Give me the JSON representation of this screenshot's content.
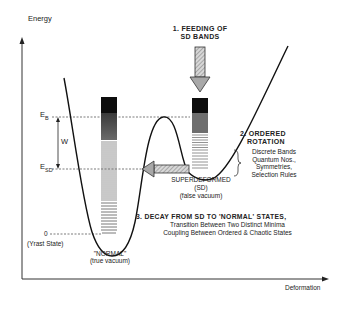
{
  "axes": {
    "y_label": "Energy",
    "x_label": "Deformation"
  },
  "energy_levels": {
    "eb_label": "E",
    "eb_sub": "B",
    "esd_label": "E",
    "esd_sub": "SD",
    "width_label": "W",
    "zero_label": "0",
    "zero_note": "(Yrast State)"
  },
  "wells": {
    "normal": {
      "line1": "\"NORMAL\"",
      "line2": "(true vacuum)"
    },
    "superdeformed": {
      "line1": "SUPERDEFORMED",
      "line2": "(SD)",
      "line3": "(false vacuum)"
    }
  },
  "steps": {
    "step1": {
      "line1": "1. FEEDING OF",
      "line2": "SD BANDS"
    },
    "step2": {
      "title1": "2. ORDERED",
      "title2": "ROTATION",
      "items": [
        "Discrete Bands",
        "Quantum Nos.,",
        "Symmetries,",
        "Selection Rules"
      ]
    },
    "step3": {
      "title": "3. DECAY FROM SD TO 'NORMAL' STATES,",
      "line1": "Transition Between Two Distinct Minima",
      "line2": "Coupling Between Ordered & Chaotic States"
    }
  },
  "colors": {
    "ink": "#1a1a1a",
    "axis": "#333333",
    "bar_black": "#0d0d0d",
    "bar_dark": "#4a4a4a",
    "bar_mid": "#8a8a8a",
    "arrow_fill": "#b5b5b5"
  }
}
